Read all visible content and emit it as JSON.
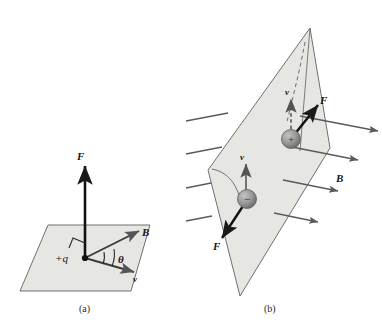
{
  "figure": {
    "background_color": "#ffffff",
    "plane_fill": "#e6e6e3",
    "plane_stroke": "#6f6f6f",
    "vector_color": "#1a1a1a",
    "field_line_color": "#5a5a5a",
    "sphere_color": "#8a8a8a"
  },
  "panel_a": {
    "caption": "(a)",
    "charge_label": "+q",
    "vectors": [
      {
        "name": "force",
        "label": "F"
      },
      {
        "name": "magnetic-field",
        "label": "B"
      },
      {
        "name": "velocity",
        "label": "v"
      }
    ],
    "angle_label": "θ",
    "right_angle_marker": true
  },
  "panel_b": {
    "caption": "(b)",
    "field_label": "B",
    "charges": [
      {
        "name": "positive-charge",
        "sign": "+",
        "velocity_label": "v",
        "force_label": "F",
        "velocity_style": "dashed"
      },
      {
        "name": "negative-charge",
        "sign": "−",
        "velocity_label": "v",
        "force_label": "F",
        "velocity_style": "solid"
      }
    ],
    "field_line_count": 8
  }
}
